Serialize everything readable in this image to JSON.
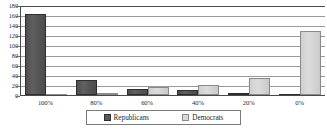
{
  "chart_data": {
    "type": "bar",
    "title": "",
    "subtitle": "",
    "xlabel": "",
    "ylabel": "",
    "categories": [
      "100%",
      "80%",
      "60%",
      "40%",
      "20%",
      "0%"
    ],
    "series": [
      {
        "name": "Republicans",
        "color": "#595959",
        "values": [
          162,
          31,
          13,
          11,
          2,
          0
        ]
      },
      {
        "name": "Democrats",
        "color": "#d9d9d9",
        "values": [
          0,
          3,
          16,
          21,
          35,
          128
        ]
      }
    ],
    "ylim": [
      0,
      180
    ],
    "ytick_step": 20,
    "yticks": [
      180,
      160,
      140,
      120,
      100,
      80,
      60,
      40,
      20,
      0
    ],
    "ytick_labels": [
      "180",
      "160",
      "140",
      "120",
      "100",
      "80",
      "60",
      "40",
      "20",
      "0"
    ],
    "grid": true,
    "grid_axis": "y",
    "legend_position": "bottom-center",
    "legend_entries": [
      "Republicans",
      "Democrats"
    ]
  },
  "axes": {
    "y_tick_labels": [
      "180",
      "160",
      "140",
      "120",
      "100",
      "80",
      "60",
      "40",
      "20",
      "0"
    ],
    "x_tick_labels": [
      "100%",
      "80%",
      "60%",
      "40%",
      "20%",
      "0%"
    ]
  },
  "legend": {
    "entries": [
      {
        "label": "Republicans",
        "swatch": "republicans-swatch"
      },
      {
        "label": "Democrats",
        "swatch": "democrats-swatch"
      }
    ]
  }
}
